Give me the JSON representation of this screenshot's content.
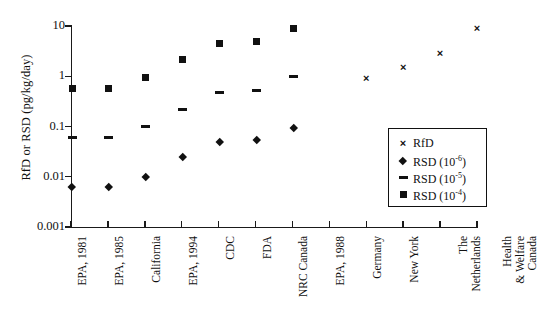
{
  "chart_data": {
    "type": "scatter",
    "title": "",
    "xlabel": "",
    "ylabel": "RfD or RSD (pg/kg/day)",
    "yscale": "log",
    "ylim": [
      0.001,
      10
    ],
    "ytick_labels": [
      "10",
      "1",
      "0.1",
      "0.01",
      "0.001"
    ],
    "ytick_values": [
      10,
      1,
      0.1,
      0.01,
      0.001
    ],
    "grid": false,
    "legend_position": "right-inside",
    "categories": [
      "EPA, 1981",
      "EPA, 1985",
      "California",
      "EPA, 1994",
      "CDC",
      "FDA",
      "NRC Canada",
      "EPA, 1988",
      "Germany",
      "New York",
      "The\nNetherlands",
      "Health\n& Welfare\nCanada"
    ],
    "series": [
      {
        "name": "RfD",
        "marker": "cross",
        "values": [
          null,
          null,
          null,
          null,
          null,
          null,
          null,
          null,
          0.9,
          1.5,
          2.9,
          9.0
        ]
      },
      {
        "name": "RSD (10⁻⁶)",
        "marker": "diamond",
        "values": [
          0.0063,
          0.0063,
          0.01,
          0.025,
          0.049,
          0.055,
          0.095,
          null,
          null,
          null,
          null,
          null
        ],
        "offset": 1
      },
      {
        "name": "RSD (10⁻⁵)",
        "marker": "dash",
        "values": [
          0.06,
          0.06,
          0.098,
          0.22,
          0.47,
          0.52,
          1.0,
          null,
          null,
          null,
          null,
          null
        ],
        "offset": 1
      },
      {
        "name": "RSD (10⁻⁴)",
        "marker": "square",
        "values": [
          0.58,
          0.57,
          0.95,
          2.2,
          4.4,
          4.9,
          8.8,
          null,
          null,
          null,
          null,
          null
        ],
        "offset": 1
      }
    ]
  },
  "legend": {
    "entries": [
      {
        "label": "RfD",
        "mark": "cross-icon"
      },
      {
        "label": "RSD (10",
        "sup": "-6",
        "close": ")",
        "mark": "diamond-icon"
      },
      {
        "label": "RSD (10",
        "sup": "-5",
        "close": ")",
        "mark": "dash-icon"
      },
      {
        "label": "RSD (10",
        "sup": "-4",
        "close": ")",
        "mark": "square-icon"
      }
    ]
  },
  "colors": {
    "marker": "#111111",
    "axis": "#1a1a1a",
    "background": "#ffffff"
  }
}
